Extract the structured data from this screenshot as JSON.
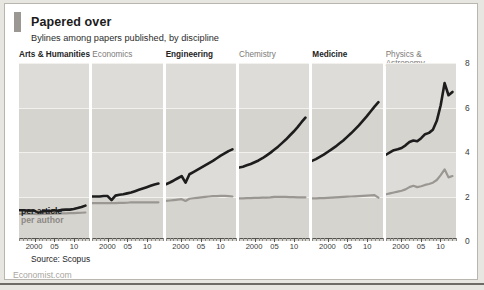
{
  "header": {
    "title": "Papered over",
    "subtitle": "Bylines among papers published, by discipline",
    "accent_color": "#9b9894"
  },
  "footer": {
    "source": "Source: Scopus",
    "brand": "Economist.com"
  },
  "series_labels": {
    "per_article": "per article",
    "per_author": "per author"
  },
  "colors": {
    "per_article": "#1d1d1d",
    "per_author": "#9a9792",
    "panel_background": "#dedcd8",
    "panel_band": "#d6d4cf",
    "gridline": "#f2f1ee",
    "axis": "#55534f",
    "highlight_title": "#232323",
    "muted_title": "#7c7a77"
  },
  "axes": {
    "y_ticks": [
      "0",
      "2",
      "4",
      "6",
      "8"
    ],
    "y_values": [
      0,
      2,
      4,
      6,
      8
    ],
    "ylim": [
      0,
      8
    ],
    "x_ticks": [
      "2000",
      "05",
      "10"
    ],
    "x_tick_values": [
      2000,
      2005,
      2010
    ],
    "xlim": [
      1996,
      2014
    ]
  },
  "chart_data": {
    "type": "line",
    "title": "Papered over",
    "subtitle": "Bylines among papers published, by discipline",
    "xlabel": "",
    "ylabel": "",
    "ylim": [
      0,
      8
    ],
    "xlim": [
      1996,
      2014
    ],
    "grid": true,
    "legend": "inline",
    "source": "Source: Scopus",
    "x": [
      1996,
      1997,
      1998,
      1999,
      2000,
      2001,
      2002,
      2003,
      2004,
      2005,
      2006,
      2007,
      2008,
      2009,
      2010,
      2011,
      2012,
      2013
    ],
    "panels": [
      {
        "name": "Arts & Humanities",
        "highlight": true,
        "series": [
          {
            "name": "per article",
            "values": [
              1.38,
              1.38,
              1.37,
              1.37,
              1.36,
              1.24,
              1.33,
              1.34,
              1.35,
              1.38,
              1.36,
              1.4,
              1.41,
              1.41,
              1.44,
              1.48,
              1.53,
              1.59
            ]
          },
          {
            "name": "per author",
            "values": [
              1.22,
              1.22,
              1.22,
              1.22,
              1.22,
              1.21,
              1.22,
              1.22,
              1.22,
              1.23,
              1.23,
              1.24,
              1.24,
              1.25,
              1.25,
              1.26,
              1.27,
              1.28
            ]
          }
        ]
      },
      {
        "name": "Economics",
        "highlight": false,
        "series": [
          {
            "name": "per article",
            "values": [
              2.0,
              2.0,
              2.0,
              2.02,
              2.02,
              1.84,
              2.04,
              2.08,
              2.1,
              2.14,
              2.18,
              2.24,
              2.3,
              2.36,
              2.42,
              2.48,
              2.54,
              2.58
            ]
          },
          {
            "name": "per author",
            "values": [
              1.7,
              1.7,
              1.7,
              1.7,
              1.7,
              1.7,
              1.7,
              1.71,
              1.71,
              1.72,
              1.74,
              1.74,
              1.74,
              1.74,
              1.74,
              1.74,
              1.74,
              1.74
            ]
          }
        ]
      },
      {
        "name": "Engineering",
        "highlight": true,
        "series": [
          {
            "name": "per article",
            "values": [
              2.55,
              2.63,
              2.72,
              2.82,
              2.92,
              2.62,
              3.0,
              3.1,
              3.2,
              3.3,
              3.4,
              3.5,
              3.6,
              3.72,
              3.84,
              3.94,
              4.04,
              4.12
            ]
          },
          {
            "name": "per author",
            "values": [
              1.8,
              1.82,
              1.84,
              1.86,
              1.88,
              1.8,
              1.9,
              1.92,
              1.94,
              1.96,
              1.98,
              2.0,
              2.02,
              2.02,
              2.03,
              2.03,
              2.02,
              2.0
            ]
          }
        ]
      },
      {
        "name": "Chemistry",
        "highlight": false,
        "series": [
          {
            "name": "per article",
            "values": [
              3.3,
              3.34,
              3.4,
              3.46,
              3.54,
              3.62,
              3.72,
              3.84,
              3.96,
              4.1,
              4.24,
              4.4,
              4.56,
              4.74,
              4.92,
              5.12,
              5.34,
              5.54
            ]
          },
          {
            "name": "per author",
            "values": [
              1.92,
              1.92,
              1.93,
              1.93,
              1.94,
              1.94,
              1.95,
              1.95,
              1.96,
              1.98,
              1.98,
              1.98,
              1.98,
              1.97,
              1.97,
              1.96,
              1.96,
              1.96
            ]
          }
        ]
      },
      {
        "name": "Medicine",
        "highlight": true,
        "series": [
          {
            "name": "per article",
            "values": [
              3.6,
              3.68,
              3.78,
              3.88,
              4.0,
              4.12,
              4.24,
              4.38,
              4.52,
              4.68,
              4.84,
              5.02,
              5.2,
              5.4,
              5.6,
              5.82,
              6.04,
              6.24
            ]
          },
          {
            "name": "per author",
            "values": [
              1.92,
              1.92,
              1.93,
              1.93,
              1.94,
              1.95,
              1.96,
              1.97,
              1.98,
              1.99,
              2.0,
              2.01,
              2.02,
              2.03,
              2.04,
              2.05,
              2.06,
              1.95
            ]
          }
        ]
      },
      {
        "name": "Physics & Astronomy",
        "highlight": false,
        "series": [
          {
            "name": "per article",
            "values": [
              3.88,
              3.98,
              4.08,
              4.12,
              4.18,
              4.3,
              4.45,
              4.52,
              4.48,
              4.62,
              4.8,
              4.86,
              5.0,
              5.4,
              6.1,
              7.1,
              6.55,
              6.7
            ]
          },
          {
            "name": "per author",
            "values": [
              2.1,
              2.14,
              2.18,
              2.22,
              2.26,
              2.32,
              2.42,
              2.48,
              2.42,
              2.46,
              2.52,
              2.56,
              2.62,
              2.74,
              2.96,
              3.22,
              2.86,
              2.92
            ]
          }
        ]
      }
    ]
  }
}
